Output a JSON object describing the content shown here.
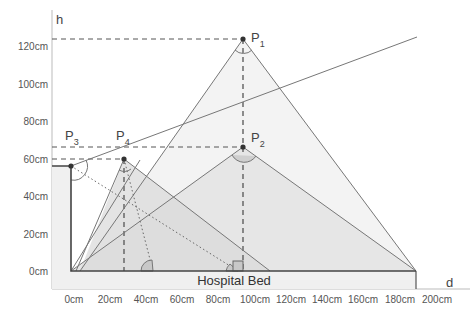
{
  "diagram": {
    "axes": {
      "x_label": "d",
      "y_label": "h",
      "x_ticks": [
        "0cm",
        "20cm",
        "40cm",
        "60cm",
        "80cm",
        "100cm",
        "120cm",
        "140cm",
        "160cm",
        "180cm",
        "200cm"
      ],
      "y_ticks": [
        "120cm",
        "100cm",
        "80cm",
        "60cm",
        "40cm",
        "20cm",
        "0cm"
      ]
    },
    "points": [
      {
        "id": "P1",
        "label": "P",
        "sub": "1",
        "x_cm": 95,
        "h_cm": 124
      },
      {
        "id": "P2",
        "label": "P",
        "sub": "2",
        "x_cm": 95,
        "h_cm": 66
      },
      {
        "id": "P3",
        "label": "P",
        "sub": "3",
        "x_cm": 0,
        "h_cm": 56
      },
      {
        "id": "P4",
        "label": "P",
        "sub": "4",
        "x_cm": 29,
        "h_cm": 60
      }
    ],
    "bed_label": "Hospital Bed",
    "colors": {
      "line": "#777777",
      "dashed": "#555555",
      "fill_light": "#ececec",
      "fill_mid": "#dcdcdc",
      "bed_fill": "#f0f0f0"
    }
  }
}
